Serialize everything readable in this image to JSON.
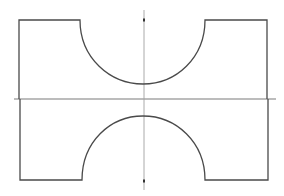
{
  "diagram": {
    "title": "Symmetric profile with semicircular notches and center axes",
    "colors": {
      "background": "#ffffff",
      "outline": "#4a4a4a",
      "axis": "#8c8c8c",
      "axis_marker": "#333333"
    },
    "shape": {
      "left_x": 19,
      "right_x": 267,
      "top_y": 20,
      "bottom_y": 180,
      "top_notch": {
        "start_x": 80,
        "end_x": 205,
        "depth_y": 84
      },
      "bottom_notch": {
        "start_x": 82,
        "end_x": 205,
        "depth_y": 116
      }
    },
    "axes": {
      "vertical": {
        "x": 144,
        "y1": 10,
        "y2": 190,
        "markers_y": [
          20,
          181
        ]
      },
      "horizontal": {
        "y": 99,
        "x1": 14,
        "x2": 276
      }
    }
  }
}
